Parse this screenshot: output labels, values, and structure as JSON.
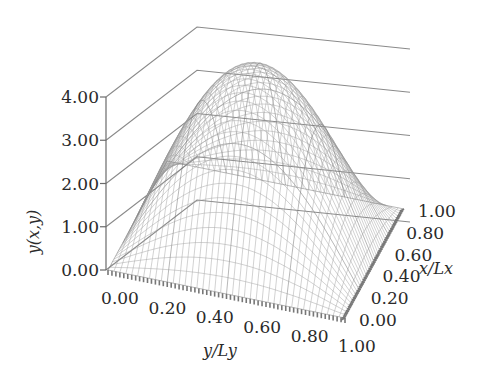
{
  "chart_data": {
    "type": "surface3d",
    "title": "",
    "function_description": "Dome-shaped surface y(x,y) = A·sin(π·x/Lx)·sin(π·y/Ly), peak at center",
    "amplitude": 4.0,
    "zlabel": "y(x,y)",
    "xlabel": "x/Lx",
    "ylabel": "y/Ly",
    "zlim": [
      0,
      4
    ],
    "xlim": [
      0,
      1
    ],
    "ylim": [
      0,
      1
    ],
    "z_ticks": [
      "0.00",
      "1.00",
      "2.00",
      "3.00",
      "4.00"
    ],
    "x_ticks": [
      "0.00",
      "0.20",
      "0.40",
      "0.60",
      "0.80",
      "1.00"
    ],
    "y_ticks": [
      "0.00",
      "0.20",
      "0.40",
      "0.60",
      "0.80",
      "1.00"
    ],
    "grid": true,
    "mesh_resolution": 40,
    "colors": {
      "mesh": "#9a9a9a",
      "axis": "#6a6a6a",
      "text": "#2a2a2a"
    },
    "sample_points": [
      {
        "x": 0.0,
        "y": 0.0,
        "z": 0.0
      },
      {
        "x": 0.5,
        "y": 0.5,
        "z": 4.0
      },
      {
        "x": 0.25,
        "y": 0.5,
        "z": 2.83
      },
      {
        "x": 0.5,
        "y": 0.25,
        "z": 2.83
      },
      {
        "x": 0.25,
        "y": 0.25,
        "z": 2.0
      },
      {
        "x": 1.0,
        "y": 1.0,
        "z": 0.0
      }
    ]
  },
  "labels": {
    "z_axis_title": "y(x,y)",
    "x_axis_title": "x/Lx",
    "y_axis_title": "y/Ly"
  }
}
